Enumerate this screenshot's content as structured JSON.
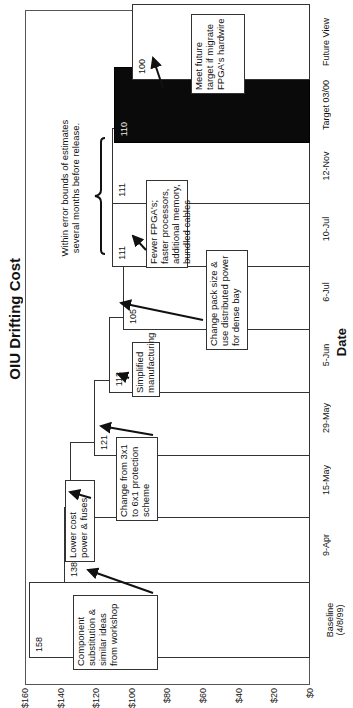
{
  "chart_data": {
    "type": "bar",
    "title": "OIU Drifting Cost",
    "xlabel": "Date",
    "ylabel": "Cost/DS1 equivalent ($)",
    "ylim": [
      0,
      160
    ],
    "yticks": [
      "$0",
      "$20",
      "$40",
      "$60",
      "$80",
      "$100",
      "$120",
      "$140",
      "$160"
    ],
    "categories": [
      "Baseline (4/8/99)",
      "9-Apr",
      "15-May",
      "29-May",
      "5-Jun",
      "6-Jul",
      "10-Jul",
      "12-Nov",
      "Target 03/00",
      "Future View"
    ],
    "values": [
      158,
      138,
      135,
      121,
      113,
      105,
      111,
      111,
      110,
      100
    ],
    "highlighted_category": "Target 03/00",
    "orientation": "rotated 90 degrees (vertical bars rendered sideways)",
    "grid": false,
    "legend": "none",
    "annotations": [
      {
        "text": "Component substitution & similar ideas from workshop",
        "points_to": "9-Apr"
      },
      {
        "text": "Lower cost power & fuses",
        "points_to": "15-May"
      },
      {
        "text": "Change from 3x1 to 6x1 protection scheme",
        "points_to": "29-May"
      },
      {
        "text": "Simplified manufacturing",
        "points_to": "5-Jun"
      },
      {
        "text": "Change pack size & use distributed power for dense bay",
        "points_to": "6-Jul"
      },
      {
        "text": "Fewer FPGA's; faster processors, additional memory, bundled cables",
        "points_to": "10-Jul"
      },
      {
        "text": "Within error bounds of estimates several months before release.",
        "spans": [
          "10-Jul",
          "12-Nov"
        ]
      },
      {
        "text": "Meet future target if migrate FPGA's hardwire",
        "points_to": "Future View"
      }
    ]
  },
  "labels": {
    "title": "OIU Drifting Cost",
    "xlabel": "Date",
    "ylabel": "Cost/DS1 equivalent ($)",
    "yticks": [
      "$0",
      "$20",
      "$40",
      "$60",
      "$80",
      "$100",
      "$120",
      "$140",
      "$160"
    ],
    "categories": [
      "Baseline",
      "9-Apr",
      "15-May",
      "29-May",
      "5-Jun",
      "6-Jul",
      "10-Jul",
      "12-Nov",
      "Target 03/00",
      "Future View"
    ],
    "baseline_sub": "(4/8/99)",
    "values": [
      "158",
      "138",
      "135",
      "121",
      "113",
      "105",
      "111",
      "111",
      "110",
      "100"
    ],
    "notes": {
      "n1": "Component substitution & similar ideas from workshop",
      "n2": "Lower cost power & fuses",
      "n3": "Change from 3x1 to 6x1 protection scheme",
      "n4": "Simplified manufacturing",
      "n5": "Change pack size & use distributed power for dense bay",
      "n6": "Fewer FPGA's; faster processors, additional memory, bundled cables",
      "n7": "Within error bounds of estimates several months before release.",
      "n8": "Meet future target if migrate FPGA's hardwire"
    }
  }
}
